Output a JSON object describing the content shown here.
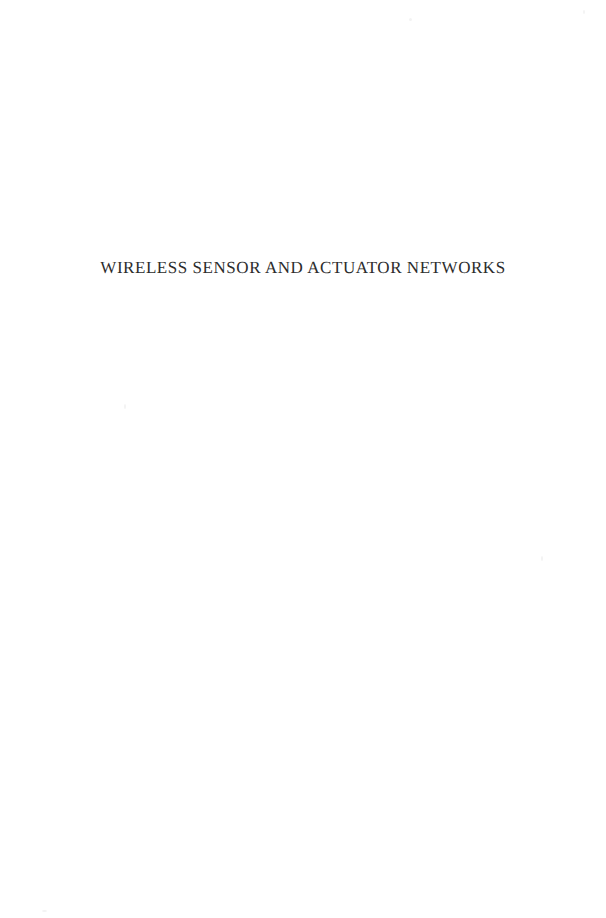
{
  "document": {
    "kind": "book-half-title-page",
    "page_width": 606,
    "page_height": 918,
    "background_color": "#ffffff",
    "text_color": "#2c2c2c"
  },
  "half_title": {
    "title": "WIRELESS SENSOR AND ACTUATOR NETWORKS",
    "alignment": "center"
  },
  "artifacts": {
    "speck_color": "#f3f3f3",
    "count": 5
  }
}
